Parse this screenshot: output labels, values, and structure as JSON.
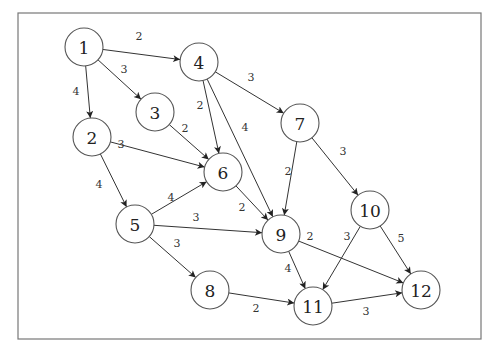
{
  "diagram": {
    "type": "weighted-directed-graph",
    "frame": {
      "x": 18,
      "y": 13,
      "width": 463,
      "height": 326
    },
    "node_radius": 19,
    "nodes": [
      {
        "id": "1",
        "label": "1",
        "x": 84,
        "y": 47
      },
      {
        "id": "2",
        "label": "2",
        "x": 92,
        "y": 137
      },
      {
        "id": "3",
        "label": "3",
        "x": 155,
        "y": 112
      },
      {
        "id": "4",
        "label": "4",
        "x": 199,
        "y": 62
      },
      {
        "id": "5",
        "label": "5",
        "x": 135,
        "y": 224
      },
      {
        "id": "6",
        "label": "6",
        "x": 223,
        "y": 172
      },
      {
        "id": "7",
        "label": "7",
        "x": 300,
        "y": 123
      },
      {
        "id": "8",
        "label": "8",
        "x": 210,
        "y": 290
      },
      {
        "id": "9",
        "label": "9",
        "x": 281,
        "y": 234
      },
      {
        "id": "10",
        "label": "10",
        "x": 370,
        "y": 210
      },
      {
        "id": "11",
        "label": "11",
        "x": 313,
        "y": 306
      },
      {
        "id": "12",
        "label": "12",
        "x": 421,
        "y": 290
      }
    ],
    "edges": [
      {
        "from": "1",
        "to": "4",
        "weight": "2",
        "lx": 139,
        "ly": 36
      },
      {
        "from": "1",
        "to": "3",
        "weight": "3",
        "lx": 124,
        "ly": 69
      },
      {
        "from": "1",
        "to": "2",
        "weight": "4",
        "lx": 76,
        "ly": 91
      },
      {
        "from": "4",
        "to": "7",
        "weight": "3",
        "lx": 251,
        "ly": 77
      },
      {
        "from": "4",
        "to": "6",
        "weight": "2",
        "lx": 200,
        "ly": 105
      },
      {
        "from": "4",
        "to": "9",
        "weight": "4",
        "lx": 245,
        "ly": 127
      },
      {
        "from": "3",
        "to": "6",
        "weight": "2",
        "lx": 185,
        "ly": 128
      },
      {
        "from": "2",
        "to": "6",
        "weight": "3",
        "lx": 121,
        "ly": 144
      },
      {
        "from": "2",
        "to": "5",
        "weight": "4",
        "lx": 99,
        "ly": 184
      },
      {
        "from": "7",
        "to": "9",
        "weight": "2",
        "lx": 288,
        "ly": 171
      },
      {
        "from": "7",
        "to": "10",
        "weight": "3",
        "lx": 343,
        "ly": 151
      },
      {
        "from": "6",
        "to": "9",
        "weight": "2",
        "lx": 242,
        "ly": 207
      },
      {
        "from": "5",
        "to": "6",
        "weight": "4",
        "lx": 171,
        "ly": 197
      },
      {
        "from": "5",
        "to": "9",
        "weight": "3",
        "lx": 196,
        "ly": 217
      },
      {
        "from": "5",
        "to": "8",
        "weight": "3",
        "lx": 177,
        "ly": 243
      },
      {
        "from": "9",
        "to": "11",
        "weight": "4",
        "lx": 288,
        "ly": 268
      },
      {
        "from": "9",
        "to": "12",
        "weight": "2",
        "lx": 310,
        "ly": 236
      },
      {
        "from": "10",
        "to": "11",
        "weight": "3",
        "lx": 347,
        "ly": 236
      },
      {
        "from": "10",
        "to": "12",
        "weight": "5",
        "lx": 401,
        "ly": 238
      },
      {
        "from": "8",
        "to": "11",
        "weight": "2",
        "lx": 256,
        "ly": 308
      },
      {
        "from": "11",
        "to": "12",
        "weight": "3",
        "lx": 366,
        "ly": 311
      }
    ]
  }
}
